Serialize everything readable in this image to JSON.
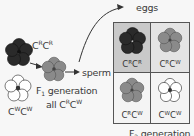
{
  "labels": {
    "eggs": "eggs",
    "sperm": "sperm",
    "parent_red": {
      "base1": "C",
      "sup1": "R",
      "base2": "C",
      "sup2": "R"
    },
    "parent_white": {
      "base1": "C",
      "sup1": "W",
      "base2": "C",
      "sup2": "W"
    },
    "f1_generation": {
      "prefix": "F",
      "sub": "1",
      "suffix": " generation"
    },
    "f1_all": {
      "prefix": "all ",
      "base1": "C",
      "sup1": "R",
      "base2": "C",
      "sup2": "W"
    },
    "f2_generation": {
      "prefix": "F",
      "sub": "2",
      "suffix": " generation"
    }
  },
  "punnett": [
    {
      "genotype": {
        "base1": "C",
        "sup1": "R",
        "base2": "C",
        "sup2": "R"
      },
      "flower": "red"
    },
    {
      "genotype": {
        "base1": "C",
        "sup1": "R",
        "base2": "C",
        "sup2": "W"
      },
      "flower": "pink"
    },
    {
      "genotype": {
        "base1": "C",
        "sup1": "R",
        "base2": "C",
        "sup2": "W"
      },
      "flower": "pink"
    },
    {
      "genotype": {
        "base1": "C",
        "sup1": "W",
        "base2": "C",
        "sup2": "W"
      },
      "flower": "white"
    }
  ],
  "colors": {
    "red_flower": "#2a2a2a",
    "pink_flower": "#8a8a8a",
    "white_flower": "#ffffff",
    "cell_dark": "#c9c9c9",
    "cell_light": "#e4e4e4"
  }
}
